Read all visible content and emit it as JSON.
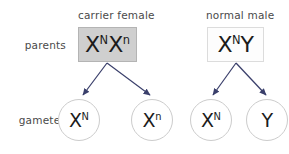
{
  "diagram": {
    "colors": {
      "female_box_fill": "#cfcfcf",
      "female_box_border": "#b4b4b4",
      "male_box_fill": "#fdfdfd",
      "male_box_border": "#dcdcdc",
      "circle_border": "#cccccc",
      "text": "#1b1b1b",
      "label_text": "#4a4a4a",
      "arrow": "#3a3f6b"
    },
    "row_labels": {
      "parents": "parents",
      "gametes": "gametes"
    },
    "captions": {
      "female": "carrier female",
      "male": "normal male"
    },
    "parents": [
      {
        "id": "carrier-female",
        "caption": "carrier female",
        "allele_1_base": "X",
        "allele_1_sup": "N",
        "allele_2_base": "X",
        "allele_2_sup": "n",
        "genotype_text": "XNXn"
      },
      {
        "id": "normal-male",
        "caption": "normal male",
        "allele_1_base": "X",
        "allele_1_sup": "N",
        "allele_2_base": "Y",
        "allele_2_sup": "",
        "genotype_text": "XNY"
      }
    ],
    "gametes": [
      {
        "id": "gamete-xn-dominant",
        "base": "X",
        "sup": "N",
        "parent": "carrier-female"
      },
      {
        "id": "gamete-xn-recessive",
        "base": "X",
        "sup": "n",
        "parent": "carrier-female"
      },
      {
        "id": "gamete-x-male",
        "base": "X",
        "sup": "N",
        "parent": "normal-male"
      },
      {
        "id": "gamete-y-male",
        "base": "Y",
        "sup": "",
        "parent": "normal-male"
      }
    ]
  }
}
